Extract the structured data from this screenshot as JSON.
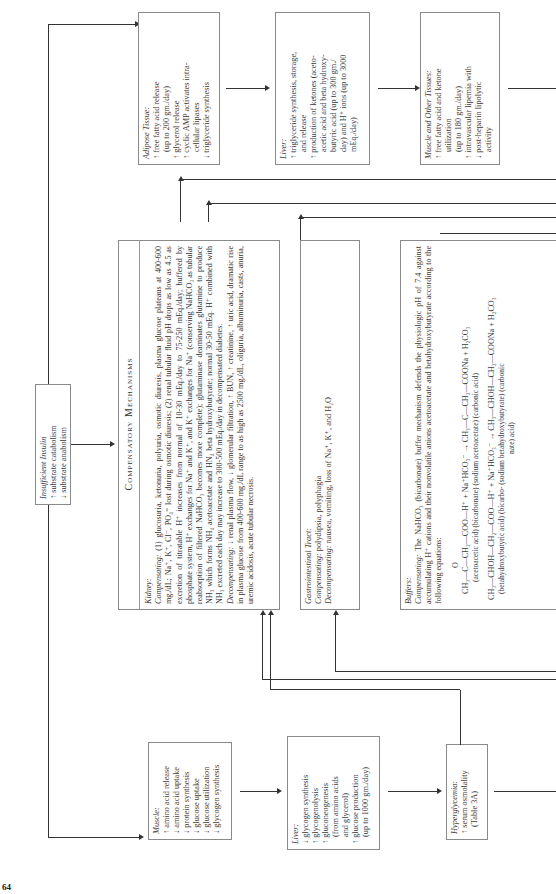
{
  "page_number": "64",
  "insufficient_insulin": {
    "title": "Insufficient Insulin",
    "lines": [
      "↑ substrate catabolism",
      "↓ substrate anabolism"
    ]
  },
  "adipose": {
    "title": "Adipose Tissue:",
    "lines": [
      "↑ free fatty acid release",
      "(up to 200 gm./day)",
      "↑ glycerol release",
      "↑ cyclic AMP activates intra-",
      "cellular lipases",
      "↓ triglyceride synthesis"
    ]
  },
  "liver_top": {
    "title": "Liver:",
    "lines": [
      "↑ triglyceride synthesis, storage,",
      "and release",
      "↑ production of ketones (aceto-",
      "acetic acid and beta hydroxy-",
      "butyric acid (up to 300 gm./",
      "day) and H⁺ ions (up to 3000",
      "mEq./day)"
    ]
  },
  "muscle_other": {
    "title": "Muscle and Other Tissues:",
    "lines": [
      "↑ free fatty acid and ketone",
      "utilization",
      "(up to 180 gm./day)",
      "↑ intravascular lipemia with",
      "↓ post-heparin lipolytic",
      "activity"
    ]
  },
  "muscle": {
    "title": "Muscle:",
    "lines": [
      "↑ amino acid release",
      "↓ amino acid uptake",
      "↓ protein synthesis",
      "↓ glucose uptake",
      "↓ glucose utilization",
      "↓ glycogen synthesis"
    ]
  },
  "liver_bottom": {
    "title": "Liver:",
    "lines": [
      "↓ glycogen synthesis",
      "↑ glycogenolysis",
      "↑ gluconeogenesis",
      "(from amino acids",
      "and glycerol)",
      "↑ glucose production",
      "(up to 1000 gm./day)"
    ]
  },
  "hyperglycemia": {
    "title": "Hyperglycemia:",
    "lines": [
      "↑ serum osmolality",
      "(Table 3A)"
    ]
  },
  "compensatory": {
    "heading": "Compensatory Mechanisms",
    "kidney": {
      "title": "Kidney:",
      "compensating_label": "Compensating:",
      "compensating_text": "(1) glucosuria, ketonuria, polyuria, osmotic diuresis, plasma glucose plateaus at 400-600 mg./dL; Na⁺, K⁺, Cl⁻, PO₄⁼ lost during osmotic diuresis; (2) renal tubular fluid pH drops as low as 4.5 as excretion of titratable H⁺ increases from normal of 10-30 mEq./day to 75-250 mEq./day; buffered by phosphate system, H⁺ exchanges for Na⁺ and K⁺, and K⁺ exchanges for Na⁺ (conserving NaHCO₃ as tubular reabsorption of filtered NaHCO₃ becomes more complete); glutaminase deaminates glutamine to produce NH₃ which forms NH₄ acetoacetate and HN₄ beta hydroxybutyrate; normal 30-50 mEq. H⁺ combined with NH₃ excreted each day may increase to 300-500 mEq./day in decompensated diabetes.",
      "decompensating_label": "Decompensating:",
      "decompensating_text": "↓ renal plasma flow, ↓ glomerular filtration, ↑ BUN, ↑ creatinine, ↑ uric acid, dramatic rise in plasma glucose from 400-600 mg./dL range to as high as 2500 mg./dL, oliguria, albuminuria, casts, anuria, uremic acidosis, acute tubular necrosis."
    },
    "gastrointestinal": {
      "title": "Gastrointestinal Tract:",
      "compensating_label": "Compensating:",
      "compensating_text": "polydipsia, polyphagia",
      "decompensating_label": "Decompensating:",
      "decompensating_text": "nausea, vomiting, loss of Na⁺, K⁺, and H₂O"
    },
    "buffers": {
      "title": "Buffers:",
      "compensating_label": "Compensating:",
      "compensating_text": "The NaHCO₃ (bicarbonate) buffer mechanism defends the physiologic pH of 7.4 against accumulating H⁺ cations and their nonvolatile anions acetoacetate and betahydroxybutyrate according to the following equations:",
      "eq1_keto": "O",
      "eq1_left": "CH₃—C—CH₂—COO—H⁺ + Na⁺HCO₃⁻ → CH₃—C—CH₂—COONa + H₂CO₃",
      "eq1_labels": "(acetoacetic acid)      (bicarbonate)       (sodium acetoacetate) (carbonic acid)",
      "eq2_left": "CH₃—CHOH—CH₂—COO—H⁺ + Na⁺HCO₃⁻ → CH₃—CHOH—CH₂—COONa + H₂CO₃",
      "eq2_labels_a": "(betahydroxybutyric acid)   (bicarbo-   (sodium betahydroxybutyrate)  (carbonic",
      "eq2_labels_b": "nate)                                                              acid)"
    }
  }
}
